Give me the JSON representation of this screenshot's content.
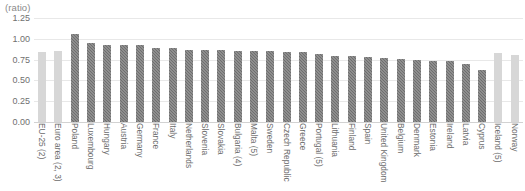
{
  "chart_data": {
    "type": "bar",
    "title": "",
    "subtitle": "",
    "unit_label": "(ratio)",
    "xlabel": "",
    "ylabel": "",
    "ylim": [
      0.0,
      1.25
    ],
    "yticks": [
      "0.00",
      "0.25",
      "0.50",
      "0.75",
      "1.00",
      "1.25"
    ],
    "ytick_values": [
      0.0,
      0.25,
      0.5,
      0.75,
      1.0,
      1.25
    ],
    "grid": true,
    "legend": "none",
    "legend_position": "none",
    "categories": [
      "EU-25 (2)",
      "Euro area (2, 3)",
      "Poland",
      "Luxembourg",
      "Hungary",
      "Austria",
      "Germany",
      "France",
      "Italy",
      "Netherlands",
      "Slovenia",
      "Slovakia",
      "Bulgaria (4)",
      "Malta (5)",
      "Sweden",
      "Czech Republic",
      "Greece",
      "Portugal (5)",
      "Lithuania",
      "Finland",
      "Spain",
      "United Kingdom",
      "Belgium",
      "Denmark",
      "Estonia",
      "Ireland",
      "Latvia",
      "Cyprus",
      "Iceland (5)",
      "Norway"
    ],
    "values": [
      0.84,
      0.85,
      1.06,
      0.95,
      0.93,
      0.93,
      0.92,
      0.89,
      0.89,
      0.87,
      0.87,
      0.87,
      0.85,
      0.85,
      0.85,
      0.84,
      0.84,
      0.82,
      0.79,
      0.79,
      0.78,
      0.77,
      0.76,
      0.75,
      0.73,
      0.73,
      0.7,
      0.62,
      0.83,
      0.81
    ],
    "series_styles": [
      "light",
      "light",
      "dark",
      "dark",
      "dark",
      "dark",
      "dark",
      "dark",
      "dark",
      "dark",
      "dark",
      "dark",
      "dark",
      "dark",
      "dark",
      "dark",
      "dark",
      "dark",
      "dark",
      "dark",
      "dark",
      "dark",
      "dark",
      "dark",
      "dark",
      "dark",
      "dark",
      "dark",
      "light",
      "light"
    ],
    "colors": {
      "aggregate_bar": "#d7d7d7",
      "country_bar": "#6e6e6e",
      "gridline": "#e8e8e8",
      "axis_text": "#6b6b6b",
      "unit_text": "#8a8a8a",
      "background": "#ffffff"
    }
  }
}
